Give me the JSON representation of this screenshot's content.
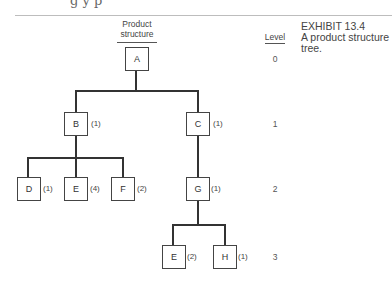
{
  "page": {
    "top_text_fragment": "g y  p"
  },
  "exhibit": {
    "number": "EXHIBIT 13.4",
    "caption_line1": "A product structure",
    "caption_line2": "tree."
  },
  "headers": {
    "product_structure_line1": "Product",
    "product_structure_line2": "structure",
    "level": "Level"
  },
  "levels": [
    "0",
    "1",
    "2",
    "3"
  ],
  "nodes": [
    {
      "id": "A",
      "label": "A",
      "qty": "",
      "level": 0
    },
    {
      "id": "B",
      "label": "B",
      "qty": "(1)",
      "level": 1
    },
    {
      "id": "C",
      "label": "C",
      "qty": "(1)",
      "level": 1
    },
    {
      "id": "D",
      "label": "D",
      "qty": "(1)",
      "level": 2
    },
    {
      "id": "E1",
      "label": "E",
      "qty": "(4)",
      "level": 2
    },
    {
      "id": "F",
      "label": "F",
      "qty": "(2)",
      "level": 2
    },
    {
      "id": "G",
      "label": "G",
      "qty": "(1)",
      "level": 2
    },
    {
      "id": "E2",
      "label": "E",
      "qty": "(2)",
      "level": 3
    },
    {
      "id": "H",
      "label": "H",
      "qty": "(1)",
      "level": 3
    }
  ],
  "edges": [
    [
      "A",
      "B"
    ],
    [
      "A",
      "C"
    ],
    [
      "B",
      "D"
    ],
    [
      "B",
      "E1"
    ],
    [
      "B",
      "F"
    ],
    [
      "C",
      "G"
    ],
    [
      "G",
      "E2"
    ],
    [
      "G",
      "H"
    ]
  ]
}
